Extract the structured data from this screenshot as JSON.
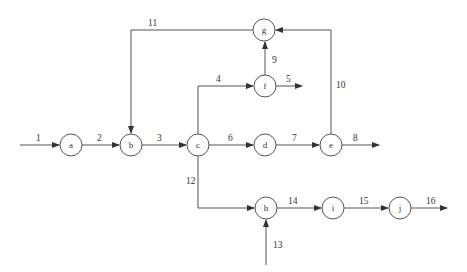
{
  "diagram": {
    "type": "flow-network",
    "colors": {
      "stroke": "#555555",
      "text": "#333333",
      "background": "#ffffff"
    },
    "nodes": [
      {
        "id": "a",
        "label": "a",
        "x": 71,
        "y": 145
      },
      {
        "id": "b",
        "label": "b",
        "x": 131,
        "y": 145
      },
      {
        "id": "c",
        "label": "c",
        "x": 198,
        "y": 145
      },
      {
        "id": "d",
        "label": "d",
        "x": 265,
        "y": 145
      },
      {
        "id": "e",
        "label": "e",
        "x": 331,
        "y": 145
      },
      {
        "id": "f",
        "label": "f",
        "x": 265,
        "y": 86
      },
      {
        "id": "g",
        "label": "g",
        "x": 264,
        "y": 30
      },
      {
        "id": "h",
        "label": "h",
        "x": 266,
        "y": 208
      },
      {
        "id": "i",
        "label": "i",
        "x": 333,
        "y": 208
      },
      {
        "id": "j",
        "label": "j",
        "x": 400,
        "y": 208
      }
    ],
    "edges": [
      {
        "label": "1",
        "from": "source",
        "to": "a"
      },
      {
        "label": "2",
        "from": "a",
        "to": "b"
      },
      {
        "label": "3",
        "from": "b",
        "to": "c"
      },
      {
        "label": "4",
        "from": "c",
        "to": "f"
      },
      {
        "label": "5",
        "from": "f",
        "to": "sink"
      },
      {
        "label": "6",
        "from": "c",
        "to": "d"
      },
      {
        "label": "7",
        "from": "d",
        "to": "e"
      },
      {
        "label": "8",
        "from": "e",
        "to": "sink"
      },
      {
        "label": "9",
        "from": "f",
        "to": "g"
      },
      {
        "label": "10",
        "from": "e",
        "to": "g"
      },
      {
        "label": "11",
        "from": "g",
        "to": "b"
      },
      {
        "label": "12",
        "from": "c",
        "to": "h"
      },
      {
        "label": "13",
        "from": "source",
        "to": "h"
      },
      {
        "label": "14",
        "from": "h",
        "to": "i"
      },
      {
        "label": "15",
        "from": "i",
        "to": "j"
      },
      {
        "label": "16",
        "from": "j",
        "to": "sink"
      }
    ]
  }
}
